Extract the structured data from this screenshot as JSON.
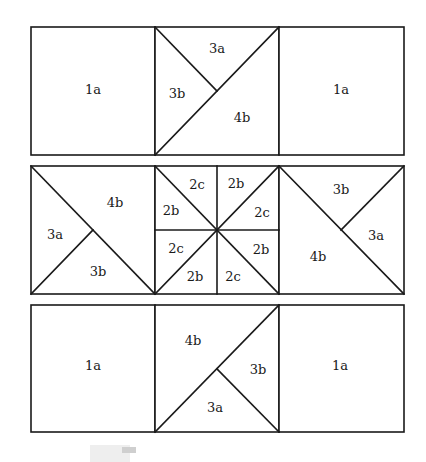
{
  "colors": {
    "line": "#1a1a1a",
    "background": "#ffffff"
  },
  "rows": [
    {
      "name": "top-row",
      "blocks": [
        {
          "name": "block-1a-left",
          "labels": [
            "1a"
          ]
        },
        {
          "name": "block-triangles",
          "labels": [
            "3a",
            "3b",
            "4b"
          ]
        },
        {
          "name": "block-1a-right",
          "labels": [
            "1a"
          ]
        }
      ]
    },
    {
      "name": "middle-row",
      "blocks": [
        {
          "name": "block-left-triangles",
          "labels": [
            "4b",
            "3a",
            "3b"
          ]
        },
        {
          "name": "block-pinwheel",
          "labels": [
            "2c",
            "2b",
            "2b",
            "2c",
            "2c",
            "2b",
            "2b",
            "2c"
          ]
        },
        {
          "name": "block-right-triangles",
          "labels": [
            "3b",
            "3a",
            "4b"
          ]
        }
      ]
    },
    {
      "name": "bottom-row",
      "blocks": [
        {
          "name": "block-1a-left",
          "labels": [
            "1a"
          ]
        },
        {
          "name": "block-triangles",
          "labels": [
            "4b",
            "3b",
            "3a"
          ]
        },
        {
          "name": "block-1a-right",
          "labels": [
            "1a"
          ]
        }
      ]
    }
  ]
}
